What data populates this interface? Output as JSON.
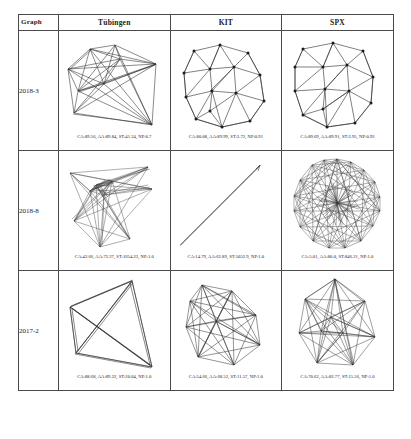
{
  "table": {
    "header": {
      "label_col": "Graph",
      "columns": [
        "Tübingen",
        "KIT",
        "SPX"
      ]
    },
    "rows": [
      {
        "label": "2018-3",
        "cells": [
          {
            "dataset": "Tübingen",
            "caption": "CA:89.56, AA:89.84, ST:41.24, NP:0.7",
            "metrics": {
              "CA": 89.56,
              "AA": 89.84,
              "ST": 41.24,
              "NP": 0.7
            },
            "layout_style": "sparse-straight-line"
          },
          {
            "dataset": "KIT",
            "caption": "CA:80.08, AA:89.99, ST:3.72, NP:0.91",
            "metrics": {
              "CA": 80.08,
              "AA": 89.99,
              "ST": 3.72,
              "NP": 0.91
            },
            "layout_style": "triangulated-grid"
          },
          {
            "dataset": "SPX",
            "caption": "CA:89.69, AA:89.91, ST:2.95, NP:0.92",
            "metrics": {
              "CA": 89.69,
              "AA": 89.91,
              "ST": 2.95,
              "NP": 0.92
            },
            "layout_style": "triangulated-grid"
          }
        ]
      },
      {
        "label": "2018-8",
        "cells": [
          {
            "dataset": "Tübingen",
            "caption": "CA:42.66, AA:72.27, ST:1654.23, NP:1.0",
            "metrics": {
              "CA": 42.66,
              "AA": 72.27,
              "ST": 1654.23,
              "NP": 1.0
            },
            "layout_style": "tangled-cluster"
          },
          {
            "dataset": "KIT",
            "caption": "CA:14.79, AA:62.89, ST:5052.9, NP:1.0",
            "metrics": {
              "CA": 14.79,
              "AA": 62.89,
              "ST": 5052.9,
              "NP": 1.0
            },
            "layout_style": "collapsed-diagonal-line"
          },
          {
            "dataset": "SPX",
            "caption": "CA:5.01, AA:80.0, ST:846.21, NP:1.0",
            "metrics": {
              "CA": 5.01,
              "AA": 80.0,
              "ST": 846.21,
              "NP": 1.0
            },
            "layout_style": "dense-radial-hairball"
          }
        ]
      },
      {
        "label": "2017-2",
        "cells": [
          {
            "dataset": "Tübingen",
            "caption": "CA:88.68, AA:89.22, ST:20.04, NP:1.0",
            "metrics": {
              "CA": 88.68,
              "AA": 89.22,
              "ST": 20.04,
              "NP": 1.0
            },
            "layout_style": "quad-with-diagonals"
          },
          {
            "dataset": "KIT",
            "caption": "CA:54.66, AA:68.52, ST:11.57, NP:1.0",
            "metrics": {
              "CA": 54.66,
              "AA": 68.52,
              "ST": 11.57,
              "NP": 1.0
            },
            "layout_style": "polygon-fan"
          },
          {
            "dataset": "SPX",
            "caption": "CA:70.63, AA:82.77, ST:15.56, NP:1.0",
            "metrics": {
              "CA": 70.63,
              "AA": 82.77,
              "ST": 15.56,
              "NP": 1.0
            },
            "layout_style": "polygon-fan-dense"
          }
        ]
      }
    ]
  },
  "colors": {
    "border": "#4a4a4a",
    "edge": "#2b2b2b",
    "node": "#1c1c1c",
    "background": "#ffffff"
  }
}
